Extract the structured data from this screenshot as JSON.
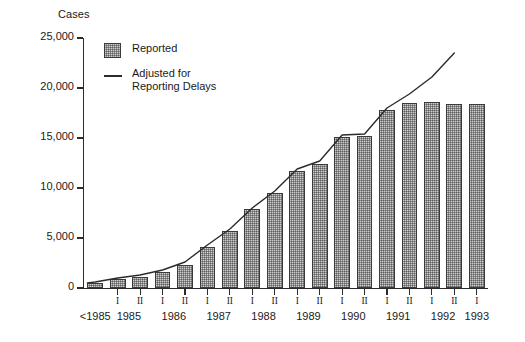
{
  "chart_data": {
    "type": "bar",
    "title": "",
    "xlabel": "",
    "ylabel": "Cases",
    "ylim": [
      0,
      25000
    ],
    "yticks": [
      0,
      5000,
      10000,
      15000,
      20000,
      25000
    ],
    "ytick_labels": [
      "0",
      "5,000",
      "10,000",
      "15,000",
      "20,000",
      "25,000"
    ],
    "grid": false,
    "legend_position": "top-left",
    "categories": [
      "<1985",
      "1985 I",
      "1985 II",
      "1986 I",
      "1986 II",
      "1987 I",
      "1987 II",
      "1988 I",
      "1988 II",
      "1989 I",
      "1989 II",
      "1990 I",
      "1990 II",
      "1991 I",
      "1991 II",
      "1992 I",
      "1992 II",
      "1993 I"
    ],
    "year_groups": [
      {
        "label": "<1985",
        "periods": [
          ""
        ]
      },
      {
        "label": "1985",
        "periods": [
          "I",
          "II"
        ]
      },
      {
        "label": "1986",
        "periods": [
          "I",
          "II"
        ]
      },
      {
        "label": "1987",
        "periods": [
          "I",
          "II"
        ]
      },
      {
        "label": "1988",
        "periods": [
          "I",
          "II"
        ]
      },
      {
        "label": "1989",
        "periods": [
          "I",
          "II"
        ]
      },
      {
        "label": "1990",
        "periods": [
          "I",
          "II"
        ]
      },
      {
        "label": "1991",
        "periods": [
          "I",
          "II"
        ]
      },
      {
        "label": "1992",
        "periods": [
          "I",
          "II"
        ]
      },
      {
        "label": "1993",
        "periods": [
          "I"
        ]
      }
    ],
    "series": [
      {
        "name": "Reported",
        "render": "bar",
        "color": "#8d8d8d",
        "values": [
          500,
          900,
          1100,
          1600,
          2300,
          4100,
          5700,
          7900,
          9500,
          11700,
          12400,
          15100,
          15200,
          17800,
          18500,
          18600,
          18400,
          18400
        ]
      },
      {
        "name": "Adjusted for Reporting Delays",
        "render": "line",
        "color": "#2b2b2b",
        "values": [
          600,
          1000,
          1300,
          1800,
          2600,
          4300,
          5900,
          8000,
          9700,
          11900,
          12700,
          15300,
          15400,
          18000,
          19400,
          21100,
          23500,
          null
        ]
      }
    ]
  },
  "legend": {
    "reported_label": "Reported",
    "adjusted_label_line1": "Adjusted for",
    "adjusted_label_line2": "Reporting Delays"
  }
}
